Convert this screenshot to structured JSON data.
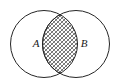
{
  "figure": {
    "name": "venn-diagram-intersection",
    "type": "venn",
    "background_color": "#ffffff",
    "stroke_color": "#262626",
    "hatch_color": "#3a3a3a",
    "width": 119,
    "height": 84
  },
  "sets": [
    {
      "id": "A",
      "label": "A",
      "label_x": 36,
      "label_y": 47,
      "center_x": 44,
      "center_y": 44,
      "radius": 33.5
    },
    {
      "id": "B",
      "label": "B",
      "label_x": 80,
      "label_y": 47,
      "center_x": 76,
      "center_y": 44,
      "radius": 33.5
    }
  ],
  "intersection": {
    "name": "A-intersect-B",
    "shaded": true,
    "fill_pattern": "diagonal-cross-hatch",
    "label": ""
  }
}
